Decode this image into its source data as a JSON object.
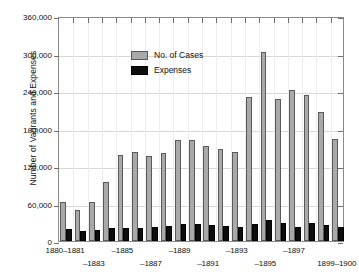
{
  "chart_data": {
    "type": "bar",
    "title": "",
    "xlabel": "",
    "ylabel": "Number of Vagrants and Expenses",
    "ylim": [
      0,
      360000
    ],
    "ytick_labels": [
      "0",
      "60,000",
      "120,000",
      "180,000",
      "240,000",
      "300,000",
      "360,000"
    ],
    "ytick_values": [
      0,
      60000,
      120000,
      180000,
      240000,
      300000,
      360000
    ],
    "grid": true,
    "legend_position": "upper-left-inside",
    "categories": [
      "1880–1881",
      "–1882",
      "–1883",
      "–1884",
      "–1885",
      "–1886",
      "–1887",
      "–1888",
      "–1889",
      "–1890",
      "–1891",
      "–1892",
      "–1893",
      "–1894",
      "–1895",
      "–1896",
      "–1897",
      "–1898",
      "–1899",
      "1899–1900"
    ],
    "visible_xtick_labels": [
      {
        "index": 0,
        "text": "1880–1881",
        "row": 0
      },
      {
        "index": 2,
        "text": "–1883",
        "row": 1
      },
      {
        "index": 4,
        "text": "–1885",
        "row": 0
      },
      {
        "index": 6,
        "text": "–1887",
        "row": 1
      },
      {
        "index": 8,
        "text": "–1889",
        "row": 0
      },
      {
        "index": 10,
        "text": "–1891",
        "row": 1
      },
      {
        "index": 12,
        "text": "–1893",
        "row": 0
      },
      {
        "index": 14,
        "text": "–1895",
        "row": 1
      },
      {
        "index": 16,
        "text": "–1897",
        "row": 0
      },
      {
        "index": 19,
        "text": "1899–1900",
        "row": 1
      }
    ],
    "series": [
      {
        "name": "No. of Cases",
        "color": "#a9a9a9",
        "values": [
          62000,
          50000,
          63000,
          95000,
          137000,
          143000,
          136000,
          141000,
          162000,
          162000,
          152000,
          148000,
          142000,
          230000,
          303000,
          228000,
          242000,
          233000,
          206000,
          163000
        ]
      },
      {
        "name": "Expenses",
        "color": "#0d0d0d",
        "values": [
          19000,
          16000,
          18000,
          21000,
          21000,
          21000,
          23000,
          24000,
          28000,
          28000,
          26000,
          24000,
          22000,
          28000,
          34000,
          29000,
          23000,
          29000,
          25000,
          22000
        ]
      }
    ]
  },
  "legend": {
    "items": [
      {
        "label": "No. of Cases",
        "swatch": "cases"
      },
      {
        "label": "Expenses",
        "swatch": "expenses"
      }
    ]
  }
}
